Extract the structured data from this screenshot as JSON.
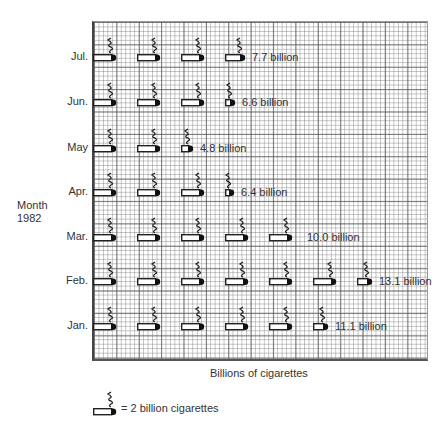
{
  "chart_data": {
    "type": "pictogram",
    "title": "",
    "xlabel": "Billions of cigarettes",
    "ylabel": "Month 1982",
    "unit": "billion",
    "icon_value": 2,
    "legend": "= 2 billion cigarettes",
    "categories": [
      "Jul.",
      "Jun.",
      "May",
      "Apr.",
      "Mar.",
      "Feb.",
      "Jan."
    ],
    "values": [
      7.7,
      6.6,
      4.8,
      6.4,
      10.0,
      13.1,
      11.1
    ],
    "value_labels": [
      "7.7 billion",
      "6.6 billion",
      "4.8 billion",
      "6.4 billion",
      "10.0 billion",
      "13.1 billion",
      "11.1 billion"
    ],
    "grid": true
  },
  "axis": {
    "ylabel_line1": "Month",
    "ylabel_line2": "1982",
    "xlabel": "Billions of cigarettes"
  },
  "rows": [
    {
      "label": "Jul.",
      "value_label": "7.7 billion",
      "full": 3,
      "partial": 0.85
    },
    {
      "label": "Jun.",
      "value_label": "6.6 billion",
      "full": 3,
      "partial": 0.3
    },
    {
      "label": "May",
      "value_label": "4.8 billion",
      "full": 2,
      "partial": 0.4
    },
    {
      "label": "Apr.",
      "value_label": "6.4 billion",
      "full": 3,
      "partial": 0.2
    },
    {
      "label": "Mar.",
      "value_label": "10.0 billion",
      "full": 5,
      "partial": 0
    },
    {
      "label": "Feb.",
      "value_label": "13.1 billion",
      "full": 6,
      "partial": 0.55
    },
    {
      "label": "Jan.",
      "value_label": "11.1 billion",
      "full": 5,
      "partial": 0.55
    }
  ],
  "legend": {
    "text": "= 2 billion cigarettes"
  }
}
